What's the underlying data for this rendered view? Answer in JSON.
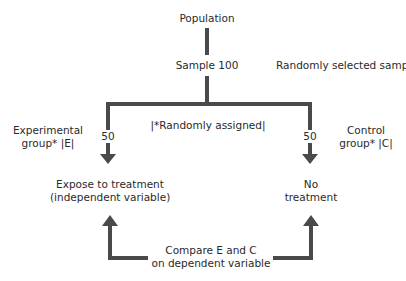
{
  "diagram": {
    "line_color": "#4a4a4a",
    "nodes": {
      "population": "Population",
      "sample": "Sample 100",
      "sample_note": "Randomly selected sample",
      "assignment_note": "|*Randomly assigned|",
      "experimental_group_line1": "Experimental",
      "experimental_group_line2": "group* |E|",
      "control_group_line1": "Control",
      "control_group_line2": "group* |C|",
      "experimental_count": "50",
      "control_count": "50",
      "treatment_line1": "Expose to treatment",
      "treatment_line2": "(independent variable)",
      "no_treatment_line1": "No",
      "no_treatment_line2": "treatment",
      "compare_line1": "Compare E and C",
      "compare_line2": "on dependent variable"
    }
  }
}
